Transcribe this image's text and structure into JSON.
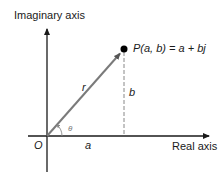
{
  "diagram": {
    "imaginary_axis_label": "Imaginary axis",
    "real_axis_label": "Real axis",
    "origin_label": "O",
    "point_label": "P(a, b) = a + bj",
    "vector_label": "r",
    "vertical_component_label": "b",
    "horizontal_component_label": "a",
    "angle_label": "θ",
    "colors": {
      "axes": "#1a1a1a",
      "vector": "#7a7a7a",
      "dashed_line": "#888888",
      "point": "#000000",
      "angle_arc": "#888888"
    },
    "geometry": {
      "origin": [
        47,
        136
      ],
      "point": [
        124,
        49
      ],
      "imag_axis_top": 27,
      "imag_axis_bottom": 172,
      "real_axis_left": 28,
      "real_axis_right": 211
    }
  }
}
